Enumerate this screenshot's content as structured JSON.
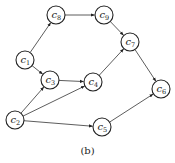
{
  "diagram": {
    "caption": "(b)",
    "nodes": [
      {
        "id": "c1",
        "letter": "c",
        "sub": "1",
        "x": 25,
        "y": 60
      },
      {
        "id": "c2",
        "letter": "c",
        "sub": "2",
        "x": 15,
        "y": 120
      },
      {
        "id": "c3",
        "letter": "c",
        "sub": "3",
        "x": 50,
        "y": 80
      },
      {
        "id": "c4",
        "letter": "c",
        "sub": "4",
        "x": 93,
        "y": 82
      },
      {
        "id": "c5",
        "letter": "c",
        "sub": "5",
        "x": 102,
        "y": 127
      },
      {
        "id": "c6",
        "letter": "c",
        "sub": "6",
        "x": 161,
        "y": 89
      },
      {
        "id": "c7",
        "letter": "c",
        "sub": "7",
        "x": 130,
        "y": 42
      },
      {
        "id": "c8",
        "letter": "c",
        "sub": "8",
        "x": 56,
        "y": 15
      },
      {
        "id": "c9",
        "letter": "c",
        "sub": "9",
        "x": 104,
        "y": 15
      }
    ],
    "edges": [
      {
        "from": "c1",
        "to": "c8"
      },
      {
        "from": "c1",
        "to": "c3"
      },
      {
        "from": "c8",
        "to": "c9"
      },
      {
        "from": "c9",
        "to": "c7"
      },
      {
        "from": "c3",
        "to": "c4"
      },
      {
        "from": "c4",
        "to": "c7"
      },
      {
        "from": "c7",
        "to": "c6"
      },
      {
        "from": "c2",
        "to": "c3"
      },
      {
        "from": "c2",
        "to": "c4"
      },
      {
        "from": "c2",
        "to": "c5"
      },
      {
        "from": "c5",
        "to": "c6"
      }
    ]
  }
}
